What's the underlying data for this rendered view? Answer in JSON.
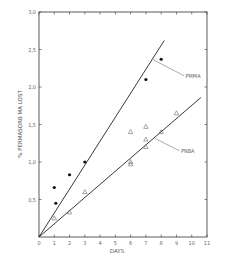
{
  "chart_data": {
    "type": "scatter",
    "title": "",
    "xlabel": "DAYS",
    "ylabel": "% PERMASORB MA LOST",
    "xlim": [
      0,
      11
    ],
    "ylim": [
      0,
      3.0
    ],
    "xticks": [
      0,
      1,
      2,
      3,
      4,
      5,
      6,
      7,
      8,
      9,
      10,
      11
    ],
    "yticks": [
      0.5,
      1.0,
      1.5,
      2.0,
      2.5,
      3.0
    ],
    "ytick_labels": [
      "0,5",
      "1,0",
      "1,5",
      "2,0",
      "2,5",
      "3,0"
    ],
    "grid": false,
    "series": [
      {
        "name": "PMMA",
        "marker": "filled-circle",
        "points": [
          [
            1,
            0.66
          ],
          [
            1.1,
            0.45
          ],
          [
            2,
            0.83
          ],
          [
            3,
            1.0
          ],
          [
            7,
            2.1
          ],
          [
            8,
            2.37
          ]
        ],
        "fit_line": [
          [
            0,
            0
          ],
          [
            8.2,
            2.62
          ]
        ],
        "label_pos": [
          9.6,
          2.15
        ]
      },
      {
        "name": "PNBA",
        "marker": "open-triangle",
        "points": [
          [
            1,
            0.25
          ],
          [
            2,
            0.33
          ],
          [
            3,
            0.6
          ],
          [
            6,
            1.4
          ],
          [
            6,
            1.0
          ],
          [
            6,
            0.97
          ],
          [
            7,
            1.3
          ],
          [
            7,
            1.2
          ],
          [
            7,
            1.47
          ],
          [
            8,
            1.4
          ],
          [
            9,
            1.65
          ]
        ],
        "fit_line": [
          [
            0,
            0
          ],
          [
            10.6,
            1.86
          ]
        ],
        "label_pos": [
          9.3,
          1.15
        ]
      }
    ]
  }
}
